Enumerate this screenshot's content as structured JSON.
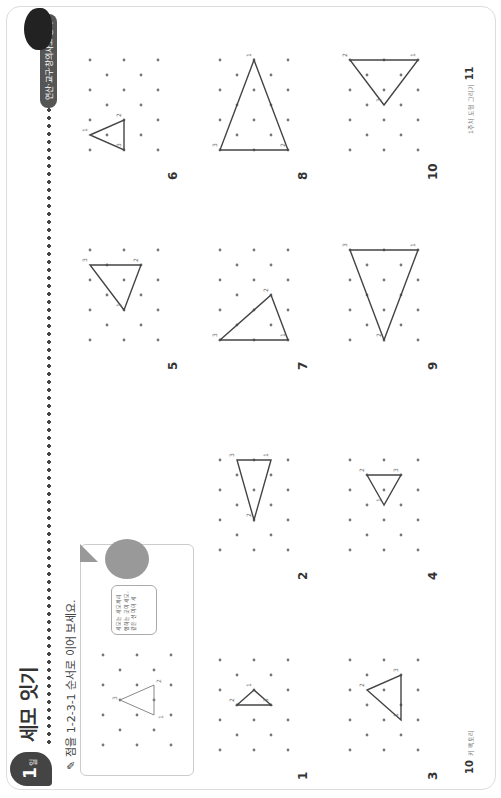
{
  "header": {
    "day_badge": "1",
    "day_suffix": "일",
    "title": "세모 잇기",
    "tag": "연산·교구·창의사고 종이",
    "instruction": "점을 1-2-3-1 순서로 이어 보세요."
  },
  "example": {
    "bubble_text": "세모는 세모끼리 합하는 곳이 세모, 같은 선 이어 세",
    "labels": [
      "1",
      "2",
      "3"
    ]
  },
  "problems": [
    {
      "number": "1",
      "labels": [
        "1",
        "2",
        "3"
      ]
    },
    {
      "number": "2",
      "labels": [
        "1",
        "2",
        "3"
      ]
    },
    {
      "number": "3",
      "labels": [
        "1",
        "2",
        "3"
      ]
    },
    {
      "number": "4",
      "labels": [
        "1",
        "2",
        "3"
      ]
    },
    {
      "number": "5",
      "labels": [
        "1",
        "2",
        "3"
      ]
    },
    {
      "number": "6",
      "labels": [
        "1",
        "2",
        "3"
      ]
    },
    {
      "number": "7",
      "labels": [
        "1",
        "2",
        "3"
      ]
    },
    {
      "number": "8",
      "labels": [
        "1",
        "2",
        "3"
      ]
    },
    {
      "number": "9",
      "labels": [
        "1",
        "2",
        "3"
      ]
    },
    {
      "number": "10",
      "labels": [
        "1",
        "2",
        "3"
      ]
    }
  ],
  "footer": {
    "left_page": "10",
    "left_text": "키 팩토리",
    "right_page": "11",
    "right_text": "1주차 도형 그리기"
  }
}
